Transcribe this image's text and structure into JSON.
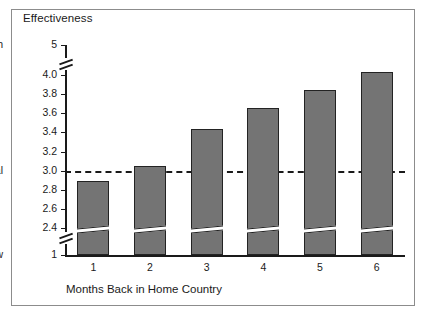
{
  "figure": {
    "title": "Effectiveness",
    "x_axis_title": "Months Back in Home Country"
  },
  "axis": {
    "high_label": "High",
    "neutral_label": "Neutral",
    "low_label": "Low",
    "top_value_label": "5",
    "bottom_value_label": "1",
    "ticks": [
      "4.0",
      "3.8",
      "3.6",
      "3.4",
      "3.2",
      "3.0",
      "2.8",
      "2.6",
      "2.4"
    ]
  },
  "colors": {
    "bar_fill": "#747474",
    "bar_border": "#232323",
    "axis": "#1a1a1a",
    "frame": "#8c8c8c",
    "background": "#ffffff"
  },
  "chart_data": {
    "type": "bar",
    "title": "Effectiveness",
    "xlabel": "Months Back in Home Country",
    "ylabel": "Effectiveness",
    "categories": [
      "1",
      "2",
      "3",
      "4",
      "5",
      "6"
    ],
    "values": [
      2.89,
      3.05,
      3.44,
      3.65,
      3.84,
      4.03
    ],
    "ylim": [
      1,
      5
    ],
    "y_broken_axis": true,
    "y_break_lower": [
      1,
      2.3
    ],
    "y_break_upper": [
      4.15,
      5
    ],
    "y_tick_labels": [
      "5",
      "4.0",
      "3.8",
      "3.6",
      "3.4",
      "3.2",
      "3.0",
      "2.8",
      "2.6",
      "2.4",
      "1"
    ],
    "y_anchor_labels": {
      "top": "High",
      "middle": "Neutral",
      "bottom": "Low"
    },
    "reference_line": {
      "value": 3.0,
      "label": "Neutral",
      "style": "dashed"
    },
    "grid": false,
    "legend": null
  }
}
